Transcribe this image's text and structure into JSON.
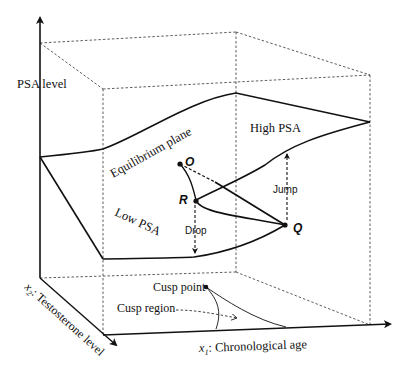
{
  "diagram": {
    "type": "cusp-catastrophe-surface",
    "axes": {
      "z_label": "PSA level",
      "x1_label_var": "x",
      "x1_label_sub": "1",
      "x1_label_rest": ": Chronological age",
      "x2_label_var": "x",
      "x2_label_sub": "2",
      "x2_label_rest": ": Testosterone level"
    },
    "surface_labels": {
      "equilibrium": "Equilibrium plane",
      "high": "High PSA",
      "low": "Low PSA"
    },
    "points": {
      "o": "O",
      "r": "R",
      "q": "Q"
    },
    "transitions": {
      "jump": "Jump",
      "drop": "Drop"
    },
    "base_labels": {
      "cusp_point": "Cusp point",
      "cusp_region": "Cusp region"
    }
  }
}
